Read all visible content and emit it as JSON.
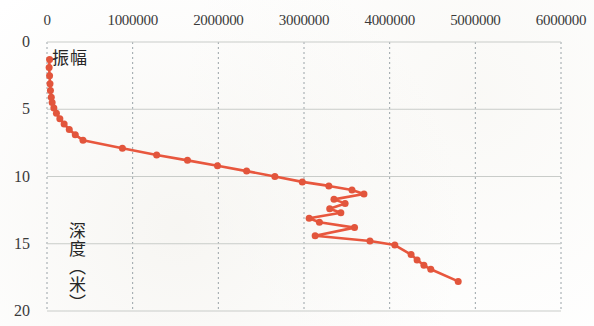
{
  "chart_data": {
    "type": "scatter",
    "title": "",
    "subtitle": "",
    "xlabel": "振幅",
    "ylabel": "深度（米）",
    "series_name": "振幅",
    "xlim": [
      0,
      6000000
    ],
    "ylim": [
      0,
      20
    ],
    "y_inverted": true,
    "x_axis_position": "top",
    "grid": true,
    "grid_style": "dashed vertical, solid horizontal",
    "legend": "none",
    "marker": "filled-circle",
    "marker_color": "#E2553C",
    "line_color": "#E8573E",
    "xticks": [
      0,
      1000000,
      2000000,
      3000000,
      4000000,
      5000000,
      6000000
    ],
    "xtick_labels": [
      "0",
      "1000000",
      "2000000",
      "3000000",
      "4000000",
      "5000000",
      "6000000"
    ],
    "yticks": [
      0,
      5,
      10,
      15,
      20
    ],
    "ytick_labels": [
      "0",
      "5",
      "10",
      "15",
      "20"
    ],
    "x": [
      30000,
      25000,
      30000,
      35000,
      40000,
      50000,
      60000,
      80000,
      110000,
      150000,
      200000,
      260000,
      330000,
      420000,
      880000,
      1280000,
      1640000,
      1990000,
      2330000,
      2660000,
      2980000,
      3290000,
      3560000,
      3700000,
      3350000,
      3480000,
      3300000,
      3430000,
      3060000,
      3180000,
      3590000,
      3130000,
      3770000,
      4060000,
      4250000,
      4320000,
      4400000,
      4480000,
      4800000
    ],
    "y": [
      1.3,
      1.9,
      2.5,
      3.1,
      3.6,
      4.1,
      4.5,
      4.9,
      5.3,
      5.7,
      6.1,
      6.5,
      6.9,
      7.3,
      7.9,
      8.4,
      8.8,
      9.2,
      9.6,
      10.0,
      10.4,
      10.7,
      11.0,
      11.3,
      11.7,
      12.0,
      12.4,
      12.7,
      13.1,
      13.4,
      13.8,
      14.4,
      14.8,
      15.1,
      15.8,
      16.2,
      16.6,
      16.9,
      17.8
    ],
    "point_count": 39
  }
}
